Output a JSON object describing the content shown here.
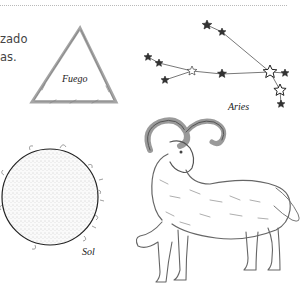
{
  "text_fragment": {
    "lines": [
      "zado",
      "as."
    ]
  },
  "labels": {
    "fire": "Fuego",
    "constellation": "Aries",
    "sun": "Sol"
  },
  "illustrations": {
    "fire_symbol": "triangle-icon",
    "constellation": "aries-constellation",
    "sun": "sun-illustration",
    "ram": "ram-illustration"
  },
  "colors": {
    "ink": "#333333",
    "sketch": "#8a8a8a",
    "rule": "#b9b9b9"
  }
}
